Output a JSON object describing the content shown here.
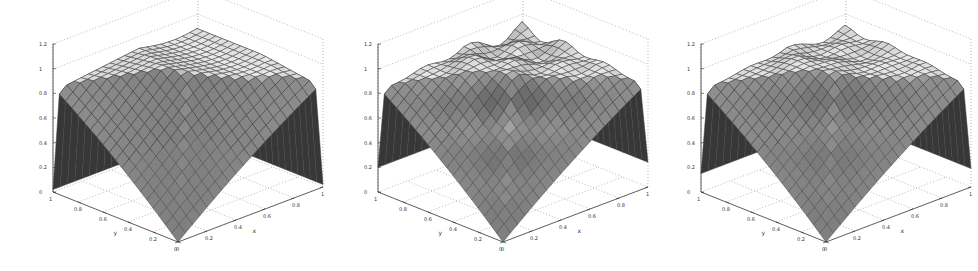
{
  "chart_data": [
    {
      "type": "surface3d",
      "title": "",
      "xlabel": "x",
      "ylabel": "y",
      "zlabel": "",
      "xlim": [
        0,
        1
      ],
      "ylim": [
        0,
        1
      ],
      "zlim": [
        0,
        1.2
      ],
      "x_ticks": [
        "0",
        "0.2",
        "0.4",
        "0.6",
        "0.8",
        "1"
      ],
      "y_ticks": [
        "0",
        "0.2",
        "0.4",
        "0.6",
        "0.8",
        "1"
      ],
      "z_ticks": [
        "0",
        "0.2",
        "0.4",
        "0.6",
        "0.8",
        "1",
        "1.2"
      ],
      "grid": true,
      "colormap": "gray",
      "surface": "pyramid peaked along diagonal, value ~1 near far corner, 0 at origin; edges drop to ~0.05",
      "peak": 1.0,
      "edge_drop": 0.0,
      "mesh_n": 20,
      "wobble": 0.0
    },
    {
      "type": "surface3d",
      "title": "",
      "xlabel": "x",
      "ylabel": "y",
      "zlabel": "",
      "xlim": [
        0,
        1
      ],
      "ylim": [
        0,
        1
      ],
      "zlim": [
        0,
        1.2
      ],
      "x_ticks": [
        "0",
        "0.2",
        "0.4",
        "0.6",
        "0.8",
        "1"
      ],
      "y_ticks": [
        "0",
        "0.2",
        "0.4",
        "0.6",
        "0.8",
        "1"
      ],
      "z_ticks": [
        "0",
        "0.2",
        "0.4",
        "0.6",
        "0.8",
        "1",
        "1.2"
      ],
      "grid": true,
      "colormap": "gray",
      "surface": "approximate pyramid with oscillating rim, sides dip to ~0.2",
      "peak": 1.0,
      "edge_drop": 0.2,
      "mesh_n": 20,
      "wobble": 0.06
    },
    {
      "type": "surface3d",
      "title": "",
      "xlabel": "x",
      "ylabel": "y",
      "zlabel": "",
      "xlim": [
        0,
        1
      ],
      "ylim": [
        0,
        1
      ],
      "zlim": [
        0,
        1.2
      ],
      "x_ticks": [
        "0",
        "0.2",
        "0.4",
        "0.6",
        "0.8",
        "1"
      ],
      "y_ticks": [
        "0",
        "0.2",
        "0.4",
        "0.6",
        "0.8",
        "1"
      ],
      "z_ticks": [
        "0",
        "0.2",
        "0.4",
        "0.6",
        "0.8",
        "1",
        "1.2"
      ],
      "grid": true,
      "colormap": "gray",
      "surface": "approximate pyramid with slight rim oscillation, sides dip to ~0.15",
      "peak": 1.0,
      "edge_drop": 0.15,
      "mesh_n": 20,
      "wobble": 0.03
    }
  ],
  "panels": [
    {
      "left": 0,
      "width": 330
    },
    {
      "left": 325,
      "width": 330
    },
    {
      "left": 648,
      "width": 330
    }
  ]
}
